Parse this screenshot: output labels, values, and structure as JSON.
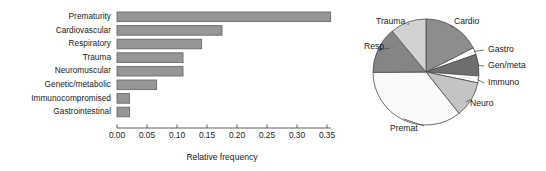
{
  "figure": {
    "background": "#ffffff",
    "bar_fill": "#969696",
    "bar_stroke": "#6b6b6b",
    "axis_color": "#4d4d4d"
  },
  "chart_data": [
    {
      "type": "bar",
      "orientation": "horizontal",
      "title": "",
      "xlabel": "Relative frequency",
      "ylabel": "",
      "xlim": [
        0.0,
        0.37
      ],
      "xticks": [
        0.0,
        0.05,
        0.1,
        0.15,
        0.2,
        0.25,
        0.3,
        0.35
      ],
      "xticklabels": [
        "0.00",
        "0.05",
        "0.10",
        "0.15",
        "0.20",
        "0.25",
        "0.30",
        "0.35"
      ],
      "grid": false,
      "legend": "none",
      "categories": [
        "Prematurity",
        "Cardiovascular",
        "Respiratory",
        "Trauma",
        "Neuromuscular",
        "Genetic/metabolic",
        "Immunocompromised",
        "Gastrointestinal"
      ],
      "values": [
        0.356,
        0.175,
        0.141,
        0.11,
        0.11,
        0.066,
        0.021,
        0.021
      ]
    },
    {
      "type": "pie",
      "title": "",
      "start_angle_deg": 90,
      "direction": "clockwise",
      "legend": "none",
      "labels": [
        "Cardio",
        "Gastro",
        "Gen/meta",
        "Immuno",
        "Neuro",
        "Premat",
        "Resp",
        "Trauma"
      ],
      "values": [
        0.175,
        0.021,
        0.066,
        0.021,
        0.11,
        0.356,
        0.141,
        0.11
      ],
      "colors": [
        "#8d8d8d",
        "#fdfdfd",
        "#6e6e6e",
        "#fbfbfb",
        "#c4c4c4",
        "#fafafa",
        "#858585",
        "#d2d2d2"
      ]
    }
  ],
  "bar_chart": {
    "axis_title": "Relative frequency",
    "tick_labels": [
      "0.00",
      "0.05",
      "0.10",
      "0.15",
      "0.20",
      "0.25",
      "0.30",
      "0.35"
    ],
    "categories": [
      {
        "label": "Prematurity",
        "value": 0.356
      },
      {
        "label": "Cardiovascular",
        "value": 0.175
      },
      {
        "label": "Respiratory",
        "value": 0.141
      },
      {
        "label": "Trauma",
        "value": 0.11
      },
      {
        "label": "Neuromuscular",
        "value": 0.11
      },
      {
        "label": "Genetic/metabolic",
        "value": 0.066
      },
      {
        "label": "Immunocompromised",
        "value": 0.021
      },
      {
        "label": "Gastrointestinal",
        "value": 0.021
      }
    ]
  },
  "pie_chart": {
    "slices": [
      {
        "label": "Cardio",
        "value": 0.175,
        "color": "#8d8d8d"
      },
      {
        "label": "Gastro",
        "value": 0.021,
        "color": "#fdfdfd"
      },
      {
        "label": "Gen/meta",
        "value": 0.066,
        "color": "#6e6e6e"
      },
      {
        "label": "Immuno",
        "value": 0.021,
        "color": "#fbfbfb"
      },
      {
        "label": "Neuro",
        "value": 0.11,
        "color": "#c4c4c4"
      },
      {
        "label": "Premat",
        "value": 0.356,
        "color": "#fafafa"
      },
      {
        "label": "Resp",
        "value": 0.141,
        "color": "#858585"
      },
      {
        "label": "Trauma",
        "value": 0.11,
        "color": "#d2d2d2"
      }
    ]
  }
}
